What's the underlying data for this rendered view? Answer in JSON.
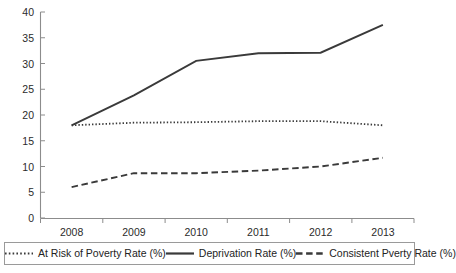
{
  "chart_data": {
    "type": "line",
    "title": "",
    "subtitle": "",
    "xlabel": "",
    "ylabel": "",
    "categories": [
      "2008",
      "2009",
      "2010",
      "2011",
      "2012",
      "2013"
    ],
    "ylim": [
      0,
      40
    ],
    "y_ticks": [
      "0",
      "5",
      "10",
      "15",
      "20",
      "25",
      "30",
      "35",
      "40"
    ],
    "y_tick_values": [
      0,
      5,
      10,
      15,
      20,
      25,
      30,
      35,
      40
    ],
    "grid": false,
    "legend_position": "bottom",
    "series": [
      {
        "name": "At Risk of Poverty Rate (%)",
        "style": "dotted",
        "color": "#3a3a3a",
        "values": [
          18.0,
          18.5,
          18.6,
          18.8,
          18.8,
          18.0
        ]
      },
      {
        "name": "Deprivation Rate (%)",
        "style": "solid",
        "color": "#3a3a3a",
        "values": [
          18.0,
          23.8,
          30.5,
          32.0,
          32.1,
          37.5
        ]
      },
      {
        "name": "Consistent Pverty Rate (%)",
        "style": "dashed",
        "color": "#3a3a3a",
        "values": [
          6.0,
          8.7,
          8.7,
          9.2,
          10.0,
          11.7
        ]
      }
    ]
  },
  "legend": {
    "entries": [
      {
        "label": "At Risk of Poverty Rate (%)",
        "swatch": "dotted-line-swatch"
      },
      {
        "label": "Deprivation Rate (%)",
        "swatch": "solid-line-swatch"
      },
      {
        "label": "Consistent Pverty Rate (%)",
        "swatch": "dashed-line-swatch"
      }
    ]
  },
  "axes": {
    "y_labels": [
      "40",
      "35",
      "30",
      "25",
      "20",
      "15",
      "10",
      "5",
      "0"
    ],
    "x_labels": [
      "2008",
      "2009",
      "2010",
      "2011",
      "2012",
      "2013"
    ]
  }
}
